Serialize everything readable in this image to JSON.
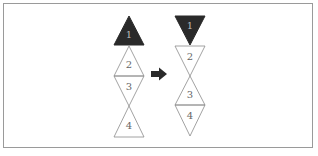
{
  "diagram": {
    "colors": {
      "frame": "#9a9a9a",
      "filled": "#2a2a2a",
      "outline": "#8a8a8a",
      "label_dark": "#bbbbbb",
      "label_light": "#666666",
      "arrow": "#2a2a2a"
    },
    "before": {
      "triangles": [
        {
          "label": "1",
          "orientation": "up",
          "filled": true
        },
        {
          "label": "2",
          "orientation": "up",
          "filled": false
        },
        {
          "label": "3",
          "orientation": "down",
          "filled": false
        },
        {
          "label": "4",
          "orientation": "up",
          "filled": false
        }
      ]
    },
    "arrow": {
      "direction": "right",
      "icon": "arrow-right-icon"
    },
    "after": {
      "triangles": [
        {
          "label": "1",
          "orientation": "down",
          "filled": true
        },
        {
          "label": "2",
          "orientation": "down",
          "filled": false
        },
        {
          "label": "3",
          "orientation": "up",
          "filled": false
        },
        {
          "label": "4",
          "orientation": "down",
          "filled": false
        }
      ]
    }
  }
}
